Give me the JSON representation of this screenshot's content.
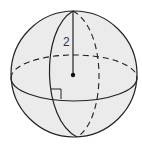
{
  "diagram": {
    "type": "sphere",
    "radius_label": "2",
    "colors": {
      "background": "#ffffff",
      "sphere_fill": "#ebebeb",
      "stroke": "#222222",
      "label": "#333333"
    },
    "elements": [
      "outer-circle",
      "equator-front-solid",
      "equator-back-dashed",
      "meridian-front-solid",
      "meridian-back-dashed",
      "radius-line",
      "center-point",
      "right-angle-marker"
    ]
  }
}
